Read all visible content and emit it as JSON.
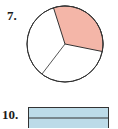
{
  "problems": [
    {
      "number": "7.",
      "figure": "circle",
      "description": "Circle divided into 3 equal parts, 1 part shaded",
      "parts": 3,
      "shaded": 1,
      "shade_color": "#f4b6a8"
    },
    {
      "number": "10.",
      "figure": "rectangle",
      "description": "Rectangle divided horizontally into parts, shaded",
      "shade_color": "#bcdbe8"
    }
  ],
  "colors": {
    "stroke": "#333333",
    "circle_fill": "#ffffff"
  }
}
